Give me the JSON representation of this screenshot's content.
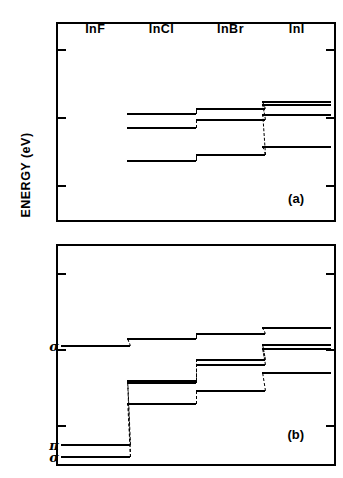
{
  "axis": {
    "ylabel": "ENERGY (eV)",
    "ticks": [
      "5",
      "10",
      "15"
    ],
    "tick_values": [
      5,
      10,
      15
    ],
    "range": [
      3.2,
      17.6
    ],
    "direction": "inverted"
  },
  "columns": [
    {
      "label": "InF",
      "x_frac": 0.135
    },
    {
      "label": "InCl",
      "x_frac": 0.375
    },
    {
      "label": "InBr",
      "x_frac": 0.625
    },
    {
      "label": "InI",
      "x_frac": 0.865
    }
  ],
  "panels": [
    {
      "tag": "(a)",
      "name": "panel-a"
    },
    {
      "tag": "(b)",
      "name": "panel-b"
    }
  ],
  "orbitals": [
    {
      "symbol": "σ",
      "energy": 9.78
    },
    {
      "symbol": "π",
      "energy": 16.35
    },
    {
      "symbol": "σ",
      "energy": 17.15
    }
  ],
  "chart_data": {
    "type": "line",
    "title": "",
    "xlabel": "",
    "ylabel": "ENERGY (eV)",
    "ylim": [
      3.2,
      17.6
    ],
    "y_inverted": true,
    "yticks": [
      5,
      10,
      15
    ],
    "grid": false,
    "legend": "none",
    "x": [
      "InF",
      "InCl",
      "InBr",
      "InI"
    ],
    "panels": [
      {
        "tag": "(a)",
        "note": "Calculated ionization energies; InF levels not plotted",
        "series": [
          {
            "name": "a1",
            "values": [
              null,
              9.8,
              9.42,
              8.92
            ]
          },
          {
            "name": "a2",
            "values": [
              null,
              9.8,
              9.42,
              9.12
            ]
          },
          {
            "name": "a3",
            "values": [
              null,
              10.85,
              10.25,
              9.85
            ]
          },
          {
            "name": "a4",
            "values": [
              null,
              13.25,
              12.85,
              12.2
            ]
          }
        ]
      },
      {
        "tag": "(b)",
        "note": "Experimental ionization energies; sigma and pi orbital labels",
        "series": [
          {
            "name": "b_sigma_top",
            "values": [
              9.78,
              9.32,
              9.02,
              8.62
            ]
          },
          {
            "name": "b2",
            "values": [
              16.35,
              12.15,
              10.72,
              9.75
            ]
          },
          {
            "name": "b3",
            "values": [
              16.35,
              12.28,
              11.05,
              10.02
            ]
          },
          {
            "name": "b_sigma_low",
            "values": [
              17.15,
              13.62,
              12.78,
              11.62
            ]
          }
        ]
      }
    ]
  },
  "levels_a": [
    {
      "col": 1,
      "e": 9.8
    },
    {
      "col": 2,
      "e": 9.42
    },
    {
      "col": 3,
      "e": 8.92
    },
    {
      "col": 3,
      "e": 9.12
    },
    {
      "col": 1,
      "e": 10.85
    },
    {
      "col": 2,
      "e": 10.25
    },
    {
      "col": 3,
      "e": 9.85
    },
    {
      "col": 1,
      "e": 13.25
    },
    {
      "col": 2,
      "e": 12.85
    },
    {
      "col": 3,
      "e": 12.2
    }
  ],
  "levels_b": [
    {
      "col": 0,
      "e": 9.78
    },
    {
      "col": 1,
      "e": 9.32
    },
    {
      "col": 2,
      "e": 9.02
    },
    {
      "col": 3,
      "e": 8.62
    },
    {
      "col": 1,
      "e": 12.15
    },
    {
      "col": 2,
      "e": 10.72
    },
    {
      "col": 3,
      "e": 9.75
    },
    {
      "col": 1,
      "e": 12.28
    },
    {
      "col": 2,
      "e": 11.05
    },
    {
      "col": 3,
      "e": 10.02
    },
    {
      "col": 0,
      "e": 16.35
    },
    {
      "col": 0,
      "e": 17.15
    },
    {
      "col": 1,
      "e": 13.62
    },
    {
      "col": 2,
      "e": 12.78
    },
    {
      "col": 3,
      "e": 11.62
    }
  ]
}
